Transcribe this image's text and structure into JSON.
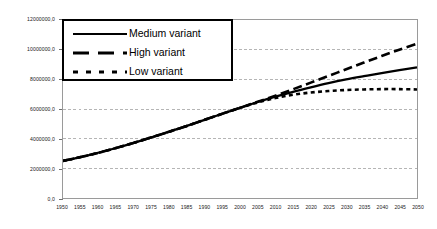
{
  "chart_data": {
    "type": "line",
    "title": "",
    "xlabel": "",
    "ylabel": "",
    "xlim": [
      1950,
      2050
    ],
    "ylim": [
      0,
      12000000
    ],
    "grid": true,
    "grid_axis": "y",
    "legend_position": "top-left",
    "decimal_separator": ",",
    "x": [
      1950,
      1955,
      1960,
      1965,
      1970,
      1975,
      1980,
      1985,
      1990,
      1995,
      2000,
      2005,
      2010,
      2015,
      2020,
      2025,
      2030,
      2035,
      2040,
      2045,
      2050
    ],
    "categories": [
      "1950",
      "1955",
      "1960",
      "1965",
      "1970",
      "1975",
      "1980",
      "1985",
      "1990",
      "1995",
      "2000",
      "2005",
      "2010",
      "2015",
      "2020",
      "2025",
      "2030",
      "2035",
      "2040",
      "2045",
      "2050"
    ],
    "y_tick_labels": [
      "0,0",
      "2000000,0",
      "4000000,0",
      "6000000,0",
      "8000000,0",
      "10000000,0",
      "12000000,0"
    ],
    "y_tick_values": [
      0,
      2000000,
      4000000,
      6000000,
      8000000,
      10000000,
      12000000
    ],
    "series": [
      {
        "name": "Medium variant",
        "style": "solid",
        "color": "#000000",
        "values": [
          2500000,
          2760000,
          3050000,
          3370000,
          3720000,
          4090000,
          4470000,
          4860000,
          5270000,
          5680000,
          6080000,
          6470000,
          6830000,
          7160000,
          7460000,
          7740000,
          7990000,
          8210000,
          8420000,
          8620000,
          8800000
        ]
      },
      {
        "name": "High variant",
        "style": "dashed",
        "color": "#000000",
        "values": [
          2500000,
          2760000,
          3050000,
          3370000,
          3720000,
          4090000,
          4470000,
          4860000,
          5270000,
          5680000,
          6080000,
          6490000,
          6900000,
          7330000,
          7780000,
          8230000,
          8680000,
          9130000,
          9570000,
          10000000,
          10400000
        ]
      },
      {
        "name": "Low variant",
        "style": "dotted",
        "color": "#000000",
        "values": [
          2500000,
          2760000,
          3050000,
          3370000,
          3720000,
          4090000,
          4470000,
          4860000,
          5270000,
          5680000,
          6080000,
          6440000,
          6740000,
          6960000,
          7110000,
          7210000,
          7280000,
          7320000,
          7340000,
          7340000,
          7320000
        ]
      }
    ]
  },
  "legend": {
    "items": [
      {
        "label": "Medium variant",
        "style": "solid"
      },
      {
        "label": "High variant",
        "style": "dashed"
      },
      {
        "label": "Low variant",
        "style": "dotted"
      }
    ]
  },
  "colors": {
    "series": "#000000",
    "gridline": "#b4b4b4",
    "axis": "#7c7c7c",
    "plot_border": "#9a9a9a",
    "legend_border": "#000000",
    "background": "#ffffff",
    "tick_text": "#202020"
  }
}
